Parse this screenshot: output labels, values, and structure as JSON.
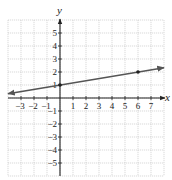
{
  "chart_data": {
    "type": "line",
    "title": "",
    "xlabel": "x",
    "ylabel": "y",
    "xlim": [
      -4,
      8
    ],
    "ylim": [
      -6,
      6
    ],
    "grid": true,
    "x_ticks": [
      -3,
      -2,
      -1,
      1,
      2,
      3,
      4,
      5,
      6,
      7
    ],
    "y_ticks": [
      -5,
      -4,
      -3,
      -2,
      -1,
      1,
      2,
      3,
      4,
      5
    ],
    "series": [
      {
        "name": "line",
        "equation": "y = (1/6)x + 1",
        "slope": 0.1667,
        "intercept": 1,
        "x": [
          -4,
          8
        ],
        "y": [
          0.333,
          2.333
        ],
        "marked_points": [
          [
            0,
            1
          ],
          [
            6,
            2
          ]
        ],
        "arrows_both_ends": true
      }
    ],
    "colors": {
      "line": "#555555",
      "axes": "#222222",
      "grid": "#bfbfbf"
    }
  }
}
